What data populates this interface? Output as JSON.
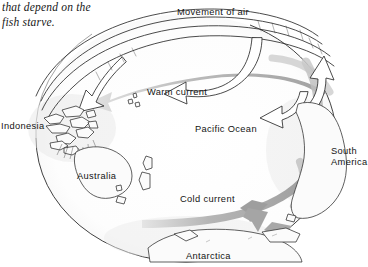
{
  "document": {
    "body_text_lines": [
      "that depend on the",
      "fish starve."
    ]
  },
  "figure": {
    "type": "globe-diagram",
    "labels": {
      "movement_of_air": "Movement of air",
      "warm_current": "Warm current",
      "cold_current": "Cold current",
      "pacific_ocean": "Pacific Ocean",
      "indonesia": "Indonesia",
      "australia": "Australia",
      "south_america_line1": "South",
      "south_america_line2": "America",
      "antarctica": "Antarctica"
    },
    "colors": {
      "background": "#ffffff",
      "outline": "#2b2b2b",
      "current_arrow": "#9a9a9a",
      "current_arrow_light": "#c3c3c3",
      "air_arrow_fill": "#ffffff",
      "air_arrow_stroke": "#2b2b2b",
      "text": "#141414"
    },
    "arrow_features": [
      {
        "name": "air-loop-upper",
        "style": "white-outlined",
        "direction": "right-to-left-over-top"
      },
      {
        "name": "air-loop-lower",
        "style": "white-outlined",
        "direction": "right-to-left-over-top"
      },
      {
        "name": "air-rise-east",
        "style": "white-outlined",
        "direction": "upward-on-right-limb"
      },
      {
        "name": "warm-current-west",
        "style": "gray-shaded",
        "direction": "east-to-west"
      },
      {
        "name": "cold-current-south",
        "style": "gray-shaded",
        "direction": "east-to-west-then-south"
      }
    ]
  }
}
